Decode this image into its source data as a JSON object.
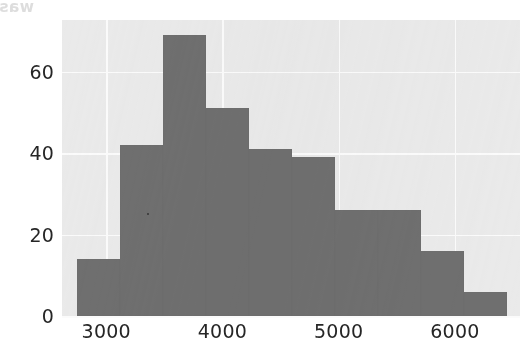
{
  "figure": {
    "background_color": "#ffffff",
    "axes_face_color": "#eaeaea",
    "bar_color": "#6f6f6f",
    "grid_color": "#fbfbfb",
    "tick_label_color": "#262626"
  },
  "scan_artifact": {
    "bleed_through_text": "was Euler's extrapolation method and most"
  },
  "chart_data": {
    "type": "bar",
    "title": "",
    "subtitle": "",
    "xlabel": "",
    "ylabel": "",
    "xlim": [
      2620,
      6560
    ],
    "ylim": [
      0,
      72.7
    ],
    "grid": true,
    "legend": null,
    "annotations": [],
    "xticks": [
      3000,
      4000,
      5000,
      6000
    ],
    "xtick_labels": [
      "3000",
      "4000",
      "5000",
      "6000"
    ],
    "yticks": [
      0,
      20,
      40,
      60
    ],
    "ytick_labels": [
      "0",
      "20",
      "40",
      "60"
    ],
    "bin_edges": [
      2750,
      3120,
      3490,
      3860,
      4230,
      4600,
      4970,
      5340,
      5710,
      6080,
      6450
    ],
    "categories": [
      "2750-3120",
      "3120-3490",
      "3490-3860",
      "3860-4230",
      "4230-4600",
      "4600-4970",
      "4970-5340",
      "5340-5710",
      "5710-6080",
      "6080-6450"
    ],
    "values": [
      14,
      42,
      69,
      51,
      41,
      39,
      26,
      26,
      16,
      6
    ]
  }
}
